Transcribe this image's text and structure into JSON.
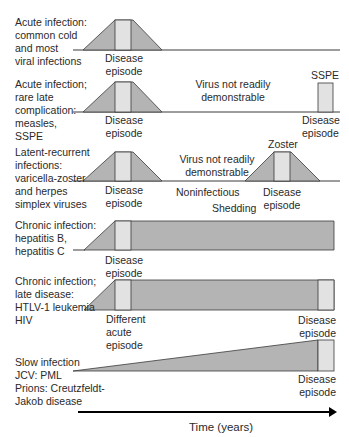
{
  "colors": {
    "dark_fill": "#b4b4b4",
    "light_fill": "#e2e2e2",
    "stroke": "#3a3a3a",
    "arrow": "#000000"
  },
  "rows": [
    {
      "title_lines": [
        "Acute infection:",
        "common cold",
        "and most",
        "viral infections"
      ],
      "episode_label": [
        "Disease",
        "episode"
      ]
    },
    {
      "title_lines": [
        "Acute infection;",
        "rare late",
        "complication:",
        "measles,",
        "SSPE"
      ],
      "episode_label": [
        "Disease",
        "episode"
      ],
      "middle_label": [
        "Virus not readily",
        "demonstrable"
      ],
      "late_label": "SSPE",
      "late_episode_label": [
        "Disease",
        "episode"
      ]
    },
    {
      "title_lines": [
        "Latent-recurrent",
        "infections:",
        "varicella-zoster",
        "and herpes",
        "simplex viruses"
      ],
      "episode_label": [
        "Disease",
        "episode"
      ],
      "middle_label": [
        "Virus not readily",
        "demonstrable"
      ],
      "noninfectious_label": "Noninfectious",
      "shedding_label": "Shedding",
      "recurrence_label": "Zoster",
      "recurrence_episode_label": [
        "Disease",
        "episode"
      ]
    },
    {
      "title_lines": [
        "Chronic infection:",
        "hepatitis B,",
        "hepatitis C"
      ],
      "episode_label": [
        "Disease",
        "episode"
      ]
    },
    {
      "title_lines": [
        "Chronic infection;",
        "late disease:",
        "HTLV-1 leukemia",
        "HIV"
      ],
      "episode_label": [
        "Different",
        "acute",
        "episode"
      ],
      "late_episode_label": [
        "Disease",
        "episode"
      ]
    },
    {
      "title_lines": [
        "Slow infection",
        "JCV: PML",
        "Prions: Creutzfeldt-",
        "Jakob disease"
      ],
      "top_episode_label": [
        "Disease",
        "episode"
      ],
      "late_episode_label": [
        "Disease",
        "episode"
      ]
    }
  ],
  "axis": {
    "label": "Time (years)"
  }
}
